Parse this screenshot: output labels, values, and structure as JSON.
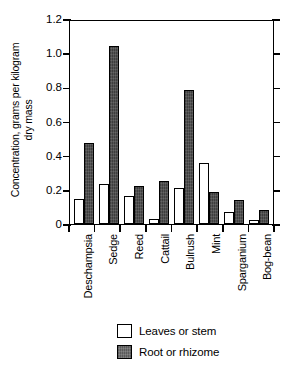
{
  "chart_data": {
    "type": "bar",
    "title": "",
    "subtitle": "",
    "xlabel": "",
    "ylabel": "Concentration, grams per kilogram dry mass",
    "ylabel_line1": "Concentration, grams per kilogram",
    "ylabel_line2": "dry mass",
    "ylim": [
      0,
      1.2
    ],
    "ytick_values": [
      0,
      0.2,
      0.4,
      0.6,
      0.8,
      1.0,
      1.2
    ],
    "ytick_labels": [
      "0",
      "0.2",
      "0.4",
      "0.6",
      "0.8",
      "1.0",
      "1.2"
    ],
    "grid": false,
    "legend_position": "bottom-center",
    "categories": [
      "Deschampsia",
      "Sedge",
      "Reed",
      "Cattail",
      "Bulrush",
      "Mint",
      "Sparganium",
      "Bog-bean"
    ],
    "series": [
      {
        "name": "Leaves or stem",
        "color": "#ffffff",
        "values": [
          0.145,
          0.235,
          0.165,
          0.03,
          0.21,
          0.355,
          0.07,
          0.025
        ]
      },
      {
        "name": "Root or rhizome",
        "color": "#4a4a4a",
        "values": [
          0.475,
          1.04,
          0.225,
          0.25,
          0.785,
          0.19,
          0.14,
          0.08
        ]
      }
    ]
  },
  "legend": {
    "items": [
      {
        "label": "Leaves or stem",
        "style": "open"
      },
      {
        "label": "Root or rhizome",
        "style": "filled"
      }
    ]
  }
}
